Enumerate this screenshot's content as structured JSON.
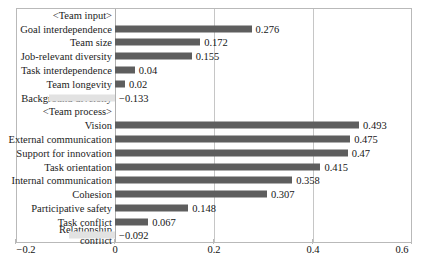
{
  "chart_data": {
    "type": "bar",
    "orientation": "horizontal",
    "title": "",
    "xlabel": "",
    "ylabel": "",
    "xlim": [
      -0.2,
      0.6
    ],
    "xticks": [
      "-0.2",
      "0",
      "0.2",
      "0.4",
      "0.6"
    ],
    "xtick_values": [
      -0.2,
      0,
      0.2,
      0.4,
      0.6
    ],
    "grid": true,
    "legend": "none",
    "group_headers": [
      "<Team input>",
      "<Team process>"
    ],
    "categories": [
      "<Team input>",
      "Goal interdependence",
      "Team size",
      "Job-relevant diversity",
      "Task interdependence",
      "Team longevity",
      "Background diversity",
      "<Team process>",
      "Vision",
      "External communication",
      "Support for innovation",
      "Task orientation",
      "Internal communication",
      "Cohesion",
      "Participative safety",
      "Task conflict",
      "Relationship conflict"
    ],
    "rows": [
      {
        "label": "<Team input>",
        "value": null,
        "value_text": "",
        "header": true
      },
      {
        "label": "Goal interdependence",
        "value": 0.276,
        "value_text": "0.276",
        "header": false
      },
      {
        "label": "Team size",
        "value": 0.172,
        "value_text": "0.172",
        "header": false
      },
      {
        "label": "Job-relevant diversity",
        "value": 0.155,
        "value_text": "0.155",
        "header": false
      },
      {
        "label": "Task interdependence",
        "value": 0.04,
        "value_text": "0.04",
        "header": false
      },
      {
        "label": "Team longevity",
        "value": 0.02,
        "value_text": "0.02",
        "header": false
      },
      {
        "label": "Background diversity",
        "value": -0.133,
        "value_text": "−0.133",
        "header": false
      },
      {
        "label": "<Team process>",
        "value": null,
        "value_text": "",
        "header": true
      },
      {
        "label": "Vision",
        "value": 0.493,
        "value_text": "0.493",
        "header": false
      },
      {
        "label": "External communication",
        "value": 0.475,
        "value_text": "0.475",
        "header": false
      },
      {
        "label": "Support for innovation",
        "value": 0.47,
        "value_text": "0.47",
        "header": false
      },
      {
        "label": "Task orientation",
        "value": 0.415,
        "value_text": "0.415",
        "header": false
      },
      {
        "label": "Internal communication",
        "value": 0.358,
        "value_text": "0.358",
        "header": false
      },
      {
        "label": "Cohesion",
        "value": 0.307,
        "value_text": "0.307",
        "header": false
      },
      {
        "label": "Participative safety",
        "value": 0.148,
        "value_text": "0.148",
        "header": false
      },
      {
        "label": "Task conflict",
        "value": 0.067,
        "value_text": "0.067",
        "header": false
      },
      {
        "label": "Relationship conflict",
        "value": -0.092,
        "value_text": "−0.092",
        "header": false
      }
    ],
    "colors": {
      "bar_positive": "#5e5e5e",
      "bar_negative": "#e2e2e2",
      "gridline": "#c6c6c6",
      "frame": "#b9b9b9",
      "text": "#1a1a1a",
      "background": "#ffffff"
    }
  }
}
